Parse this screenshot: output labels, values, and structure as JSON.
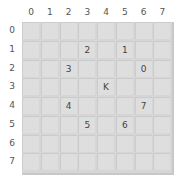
{
  "board": {
    "columns": [
      "0",
      "1",
      "2",
      "3",
      "4",
      "5",
      "6",
      "7"
    ],
    "rows": [
      "0",
      "1",
      "2",
      "3",
      "4",
      "5",
      "6",
      "7"
    ],
    "pieces": [
      {
        "row": 1,
        "col": 3,
        "label": "2"
      },
      {
        "row": 1,
        "col": 5,
        "label": "1"
      },
      {
        "row": 2,
        "col": 2,
        "label": "3"
      },
      {
        "row": 2,
        "col": 6,
        "label": "0"
      },
      {
        "row": 3,
        "col": 4,
        "label": "K"
      },
      {
        "row": 4,
        "col": 2,
        "label": "4"
      },
      {
        "row": 4,
        "col": 6,
        "label": "7"
      },
      {
        "row": 5,
        "col": 3,
        "label": "5"
      },
      {
        "row": 5,
        "col": 5,
        "label": "6"
      }
    ],
    "colors": {
      "cell": "#dedede",
      "grid": "#cbcbcb",
      "label": "#555555"
    }
  }
}
